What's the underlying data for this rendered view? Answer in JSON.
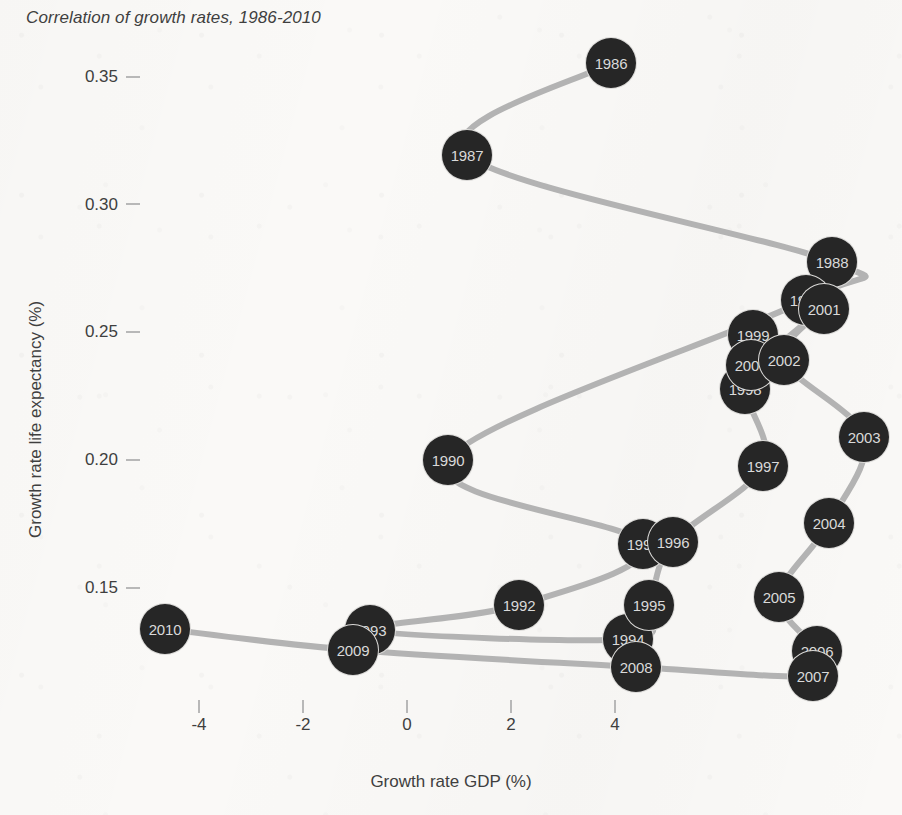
{
  "chart_data": {
    "type": "scatter",
    "title": "Correlation of growth rates, 1986-2010",
    "xlabel": "Growth rate GDP (%)",
    "ylabel": "Growth rate life expectancy (%)",
    "xlim": [
      -5.4,
      5.2
    ],
    "ylim": [
      0.128,
      0.366
    ],
    "xticks": [
      -4,
      -2,
      0,
      2,
      4
    ],
    "xtick_labels": [
      "-4",
      "-2",
      "0",
      "2",
      "4"
    ],
    "yticks": [
      0.15,
      0.2,
      0.25,
      0.3,
      0.35
    ],
    "ytick_labels": [
      "0.15",
      "0.20",
      "0.25",
      "0.30",
      "0.35"
    ],
    "grid": false,
    "legend": "none",
    "connected": true,
    "line_color": "#b3b3b3",
    "marker_color": "#262626",
    "marker_label_color": "#d9d9d9",
    "background_color": "#faf9f7",
    "point_label_key": "year",
    "points": [
      {
        "year": "1986",
        "x": 3.92,
        "y": 0.3485,
        "px": 611,
        "py": 63
      },
      {
        "year": "1987",
        "x": -1.15,
        "y": 0.3125,
        "px": 467,
        "py": 155
      },
      {
        "year": "1988",
        "x": 8.17,
        "y": 0.276,
        "px": 832,
        "py": 262
      },
      {
        "year": "1989",
        "x": 6.2,
        "y": 0.26,
        "px": 806,
        "py": 300
      },
      {
        "year": "1990",
        "x": -1.5,
        "y": 0.2015,
        "px": 448,
        "py": 460
      },
      {
        "year": "1991",
        "x": 4.54,
        "y": 0.1672,
        "px": 643,
        "py": 544
      },
      {
        "year": "1992",
        "x": 2.15,
        "y": 0.144,
        "px": 519,
        "py": 605
      },
      {
        "year": "1993",
        "x": -0.71,
        "y": 0.1345,
        "px": 370,
        "py": 630
      },
      {
        "year": "1994",
        "x": 4.25,
        "y": 0.131,
        "px": 628,
        "py": 639
      },
      {
        "year": "1995",
        "x": 4.65,
        "y": 0.144,
        "px": 649,
        "py": 605
      },
      {
        "year": "1996",
        "x": 5.12,
        "y": 0.1665,
        "px": 673,
        "py": 542
      },
      {
        "year": "1997",
        "x": 6.85,
        "y": 0.1965,
        "px": 763,
        "py": 466
      },
      {
        "year": "1998",
        "x": 6.5,
        "y": 0.231,
        "px": 745,
        "py": 389
      },
      {
        "year": "1999",
        "x": 6.65,
        "y": 0.252,
        "px": 753,
        "py": 335
      },
      {
        "year": "2000",
        "x": 6.6,
        "y": 0.24,
        "px": 751,
        "py": 365
      },
      {
        "year": "2001",
        "x": 8.02,
        "y": 0.2575,
        "px": 824,
        "py": 309
      },
      {
        "year": "2002",
        "x": 7.25,
        "y": 0.242,
        "px": 784,
        "py": 360
      },
      {
        "year": "2003",
        "x": 8.79,
        "y": 0.2105,
        "px": 864,
        "py": 437
      },
      {
        "year": "2004",
        "x": 8.12,
        "y": 0.177,
        "px": 829,
        "py": 523
      },
      {
        "year": "2005",
        "x": 7.15,
        "y": 0.1475,
        "px": 779,
        "py": 597
      },
      {
        "year": "2006",
        "x": 7.88,
        "y": 0.1265,
        "px": 817,
        "py": 651
      },
      {
        "year": "2007",
        "x": 7.81,
        "y": 0.1168,
        "px": 813,
        "py": 676
      },
      {
        "year": "2008",
        "x": 4.4,
        "y": 0.12,
        "px": 636,
        "py": 667
      },
      {
        "year": "2009",
        "x": -1.04,
        "y": 0.127,
        "px": 353,
        "py": 650
      },
      {
        "year": "2010",
        "x": -4.65,
        "y": 0.1352,
        "px": 165,
        "py": 629
      }
    ]
  },
  "axes": {
    "y_title": "Growth rate life expectancy (%)",
    "x_title": "Growth rate GDP (%)",
    "y_tick_0": "0.35",
    "y_tick_1": "0.30",
    "y_tick_2": "0.25",
    "y_tick_3": "0.20",
    "y_tick_4": "0.15",
    "x_tick_0": "-4",
    "x_tick_1": "-2",
    "x_tick_2": "0",
    "x_tick_3": "2",
    "x_tick_4": "4"
  },
  "title": "Correlation of growth rates, 1986-2010"
}
